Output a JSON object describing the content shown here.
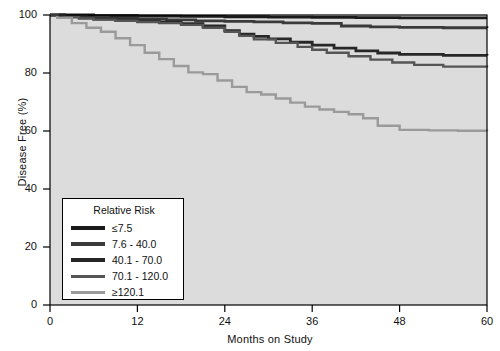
{
  "chart_data": {
    "type": "line",
    "title": "",
    "subtitle": "",
    "xlabel": "Months on Study",
    "ylabel": "Disease Free (%)",
    "xlim": [
      0,
      60
    ],
    "ylim": [
      0,
      100
    ],
    "xticks": [
      0,
      12,
      24,
      36,
      48,
      60
    ],
    "yticks": [
      0,
      20,
      40,
      60,
      80,
      100
    ],
    "grid": false,
    "legend_position": "lower-left-inside",
    "legend_title": "Relative Risk",
    "plot_style": "kaplan-meier step curves",
    "plot_background": "#dcdcdc",
    "figure_background": "#ffffff",
    "frame_color": "#000000",
    "series": [
      {
        "name": "≤7.5",
        "color": "#1a1a1a",
        "final_value": 99,
        "x": [
          0,
          1,
          6,
          12,
          18,
          24,
          30,
          36,
          42,
          48,
          54,
          60
        ],
        "values": [
          100,
          100,
          99.8,
          99.6,
          99.5,
          99.4,
          99.3,
          99.2,
          99.1,
          99.0,
          99.0,
          99.0
        ]
      },
      {
        "name": "7.6 - 40.0",
        "color": "#3a3a3a",
        "final_value": 95.5,
        "x": [
          0,
          2,
          5,
          8,
          12,
          16,
          20,
          24,
          28,
          32,
          36,
          40,
          44,
          48,
          54,
          60
        ],
        "values": [
          100,
          99.6,
          99.2,
          98.9,
          98.6,
          98.3,
          98.0,
          97.8,
          97.6,
          97.3,
          97.1,
          96.2,
          95.9,
          95.7,
          95.6,
          95.5
        ]
      },
      {
        "name": "40.1 - 70.0",
        "color": "#272727",
        "final_value": 86,
        "x": [
          0,
          2,
          4,
          6,
          9,
          12,
          15,
          18,
          21,
          24,
          26,
          28,
          30,
          33,
          36,
          39,
          42,
          45,
          48,
          54,
          60
        ],
        "values": [
          100,
          99.4,
          99.0,
          98.6,
          98.2,
          97.9,
          97.5,
          97.0,
          96.2,
          94.6,
          93.4,
          92.6,
          91.8,
          90.6,
          89.6,
          88.6,
          87.6,
          86.9,
          86.4,
          86.1,
          86.0
        ]
      },
      {
        "name": "70.1 - 120.0",
        "color": "#555555",
        "final_value": 82,
        "x": [
          0,
          2,
          4,
          6,
          9,
          12,
          15,
          18,
          21,
          24,
          26,
          28,
          31,
          34,
          36,
          38,
          41,
          44,
          47,
          50,
          54,
          60
        ],
        "values": [
          100,
          99.3,
          98.8,
          98.4,
          98.0,
          97.6,
          97.2,
          96.6,
          95.6,
          94.2,
          92.8,
          91.6,
          90.4,
          89.0,
          88.0,
          87.0,
          85.8,
          84.6,
          83.6,
          82.8,
          82.2,
          82.0
        ]
      },
      {
        "name": "≥120.1",
        "color": "#9a9a9a",
        "final_value": 60,
        "x": [
          0,
          1,
          3,
          5,
          7,
          9,
          11,
          13,
          15,
          17,
          19,
          21,
          23,
          25,
          27,
          29,
          31,
          33,
          35,
          37,
          39,
          41,
          43,
          45,
          48,
          52,
          56,
          60
        ],
        "values": [
          100,
          99.0,
          97.2,
          95.6,
          94.2,
          92.0,
          89.6,
          87.0,
          84.8,
          82.4,
          80.2,
          79.6,
          77.4,
          75.2,
          73.4,
          72.6,
          71.2,
          69.8,
          68.4,
          67.4,
          66.6,
          65.8,
          64.4,
          61.8,
          60.4,
          60.2,
          60.1,
          60.0
        ]
      }
    ]
  },
  "axes": {
    "ylabel": "Disease Free (%)",
    "xlabel": "Months on Study",
    "ytick_labels": [
      "0",
      "20",
      "40",
      "60",
      "80",
      "100"
    ],
    "xtick_labels": [
      "0",
      "12",
      "24",
      "36",
      "48",
      "60"
    ]
  },
  "legend": {
    "title": "Relative Risk",
    "items": [
      {
        "label": "≤7.5",
        "color": "#1a1a1a",
        "thickness": 4
      },
      {
        "label": "7.6 - 40.0",
        "color": "#3a3a3a",
        "thickness": 4
      },
      {
        "label": "40.1 - 70.0",
        "color": "#272727",
        "thickness": 4
      },
      {
        "label": "70.1 - 120.0",
        "color": "#555555",
        "thickness": 3
      },
      {
        "label": "≥120.1",
        "color": "#9a9a9a",
        "thickness": 3
      }
    ]
  }
}
